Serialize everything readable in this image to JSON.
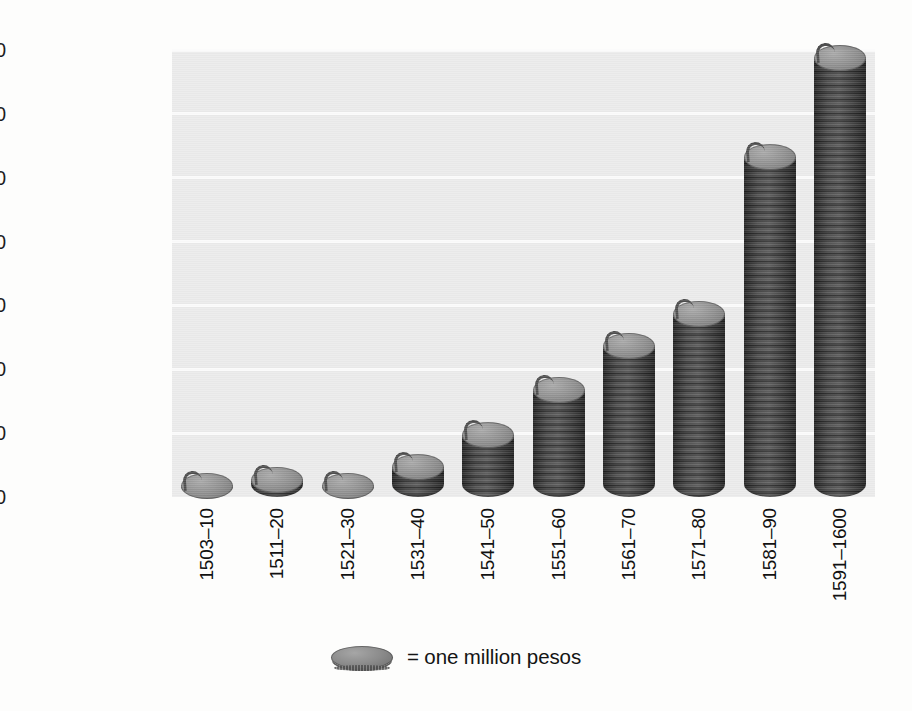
{
  "chart_data": {
    "type": "bar",
    "title": "",
    "subtitle": "",
    "xlabel": "",
    "ylabel": "",
    "categories": [
      "1503–10",
      "1511–20",
      "1521–30",
      "1531–40",
      "1541–50",
      "1551–60",
      "1561–70",
      "1571–80",
      "1581–90",
      "1591–1600"
    ],
    "values": [
      2000000,
      3000000,
      2000000,
      5000000,
      10000000,
      17000000,
      24000000,
      29000000,
      53500000,
      69000000
    ],
    "ylim": [
      0,
      70000000
    ],
    "ytick_values": [
      0,
      10000000,
      20000000,
      30000000,
      40000000,
      50000000,
      60000000,
      70000000
    ],
    "ytick_labels": [
      "0",
      "10,000,000",
      "20,000,000",
      "30,000,000",
      "40,000,000",
      "50,000,000",
      "60,000,000",
      "70,000,000"
    ],
    "grid": true,
    "grid_axis": "y",
    "legend_position": "bottom-center",
    "legend": [
      {
        "marker": "coin-stack-icon",
        "label": "= one million pesos"
      }
    ],
    "series": [
      {
        "name": "pesos",
        "values": [
          2000000,
          3000000,
          2000000,
          5000000,
          10000000,
          17000000,
          24000000,
          29000000,
          53500000,
          69000000
        ]
      }
    ],
    "units": "pesos",
    "marker_unit_value": 1000000,
    "colors": {
      "bar_fill": "#8c8c8c",
      "bar_edge": "#4e4e4e",
      "plot_background": "#ebebeb",
      "gridline": "#fbfbfb",
      "text": "#141414"
    }
  },
  "legend": {
    "equals_label": "= one million pesos"
  },
  "bleed_through": {
    "lines": [
      "seen expected a warning",
      "the eight soldiers of the",
      "a pound a hundredweight of",
      "a little the edge of the",
      "and not save any of them",
      "of pounds that coming that heard",
      "the next to the campo again",
      "that was found down the 1558",
      "nearly generally annexed",
      "The king",
      "of western the Indies",
      "made for a Royal the",
      "and the number of the"
    ]
  }
}
